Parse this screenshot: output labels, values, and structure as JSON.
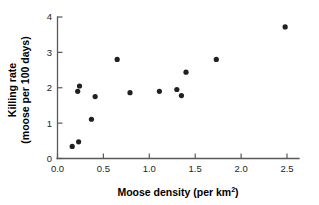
{
  "chart_data": {
    "type": "scatter",
    "title": "",
    "xlabel": "Moose density (per km2)",
    "xlabel_main": "Moose density (per km",
    "xlabel_sup": "2",
    "xlabel_tail": ")",
    "ylabel": "Killing rate (moose per 100 days)",
    "ylabel_line1": "Killing rate",
    "ylabel_line2": "(moose per 100 days)",
    "xlim": [
      0.0,
      2.6
    ],
    "ylim": [
      0.0,
      4.0
    ],
    "xticks": [
      0.0,
      0.5,
      1.0,
      1.5,
      2.0,
      2.5
    ],
    "xtick_labels": [
      "0.0",
      "0.5",
      "1.0",
      "1.5",
      "2.0",
      "2.5"
    ],
    "yticks": [
      0,
      1,
      2,
      3,
      4
    ],
    "ytick_labels": [
      "0",
      "1",
      "2",
      "3",
      "4"
    ],
    "grid": false,
    "legend": false,
    "marker": "filled-circle",
    "marker_color": "#231f20",
    "marker_size": 4.6,
    "x": [
      0.16,
      0.23,
      0.22,
      0.24,
      0.37,
      0.41,
      0.65,
      0.79,
      1.11,
      1.3,
      1.35,
      1.4,
      1.73,
      2.48
    ],
    "y": [
      0.34,
      0.47,
      1.9,
      2.05,
      1.11,
      1.75,
      2.8,
      1.86,
      1.9,
      1.95,
      1.78,
      2.44,
      2.8,
      3.72
    ],
    "points": [
      {
        "x": 0.16,
        "y": 0.34
      },
      {
        "x": 0.23,
        "y": 0.47
      },
      {
        "x": 0.22,
        "y": 1.9
      },
      {
        "x": 0.24,
        "y": 2.05
      },
      {
        "x": 0.37,
        "y": 1.11
      },
      {
        "x": 0.41,
        "y": 1.75
      },
      {
        "x": 0.65,
        "y": 2.8
      },
      {
        "x": 0.79,
        "y": 1.86
      },
      {
        "x": 1.11,
        "y": 1.9
      },
      {
        "x": 1.3,
        "y": 1.95
      },
      {
        "x": 1.35,
        "y": 1.78
      },
      {
        "x": 1.4,
        "y": 2.44
      },
      {
        "x": 1.73,
        "y": 2.8
      },
      {
        "x": 2.48,
        "y": 3.72
      }
    ]
  },
  "colors": {
    "axis": "#58595b",
    "marker": "#231f20",
    "text": "#000000",
    "background": "#ffffff"
  }
}
